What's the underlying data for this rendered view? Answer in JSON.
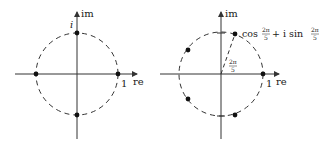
{
  "figure": {
    "left": {
      "title": "fourth roots of unity",
      "axis_x_label": "re",
      "axis_y_label": "im",
      "point_label_i": "i",
      "point_label_one": "1",
      "center": [
        77,
        74
      ],
      "radius": 41,
      "points": [
        [
          118,
          74
        ],
        [
          77,
          33
        ],
        [
          36,
          74
        ],
        [
          77,
          115
        ]
      ]
    },
    "right": {
      "title": "fifth roots of unity",
      "axis_x_label": "re",
      "axis_y_label": "im",
      "point_label_one": "1",
      "annotation_cos": "cos",
      "annotation_plus_i": "+ i sin",
      "fraction_num": "2π",
      "fraction_den": "5",
      "angle_num": "2π",
      "angle_den": "5",
      "center": [
        221,
        74
      ],
      "radius": 42
    },
    "colors": {
      "ink": "#1a1a1a",
      "axis": "#333333",
      "background": "#ffffff"
    }
  }
}
